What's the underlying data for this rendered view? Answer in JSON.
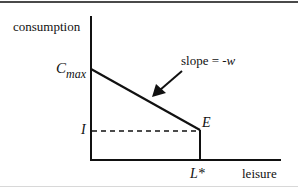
{
  "diagram": {
    "type": "budget-constraint",
    "axes": {
      "y_label": "consumption",
      "x_label": "leisure"
    },
    "points": {
      "c_max": {
        "main": "C",
        "sub": "max"
      },
      "income": "I",
      "endowment": "E",
      "leisure_star": "L*"
    },
    "annotation": {
      "slope_prefix": "slope = ",
      "slope_value": "-w"
    },
    "colors": {
      "line": "#111111",
      "frame_top": "#4a4a4a",
      "frame_bottom": "#d8d8d8",
      "background": "#ffffff"
    },
    "geometry": {
      "origin": [
        91,
        160
      ],
      "y_axis_top": [
        91,
        16
      ],
      "x_axis_end": [
        281,
        160
      ],
      "c_max_point": [
        91,
        69
      ],
      "e_point": [
        200,
        130
      ],
      "arrow_start": [
        182,
        71
      ],
      "arrow_tip": [
        152,
        97
      ]
    }
  }
}
